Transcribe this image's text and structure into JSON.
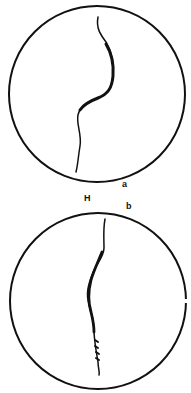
{
  "figure": {
    "panels": [
      {
        "id": "a",
        "label": "a",
        "cx": 97,
        "cy": 94,
        "r": 88
      },
      {
        "id": "b",
        "label": "b",
        "cx": 98,
        "cy": 301,
        "r": 88
      }
    ],
    "marker_label": "H",
    "colors": {
      "ink": "#111111",
      "background": "#ffffff"
    }
  }
}
